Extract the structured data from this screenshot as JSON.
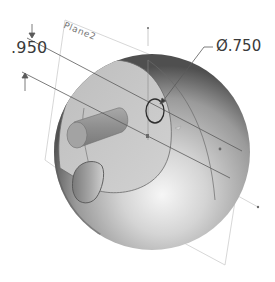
{
  "view": {
    "type": "CAD 3D model view",
    "background": "#ffffff"
  },
  "plane": {
    "label": "Plane2",
    "outline_color": "#c8c8c8"
  },
  "dimensions": {
    "linear": {
      "value": ".950"
    },
    "diameter": {
      "symbol": "Ø",
      "value": ".750",
      "label": "Ø.750"
    }
  },
  "model": {
    "shape": "sphere",
    "features": [
      "section-face",
      "cylindrical-boss",
      "hole",
      "sketch-circle"
    ],
    "colors": {
      "sphere_highlight": "#f4f4f4",
      "sphere_mid": "#b0b0b0",
      "sphere_shadow": "#4a4a4a",
      "section_face": "#c9c9c9",
      "edge": "#555555"
    }
  }
}
